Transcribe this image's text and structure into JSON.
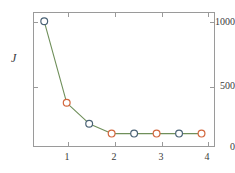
{
  "chart_data": {
    "type": "line",
    "title": "",
    "subtitle": "",
    "xlabel": "",
    "ylabel": "J",
    "x": [
      0.5,
      1.0,
      1.5,
      2.0,
      2.5,
      3.0,
      3.5,
      4.0
    ],
    "values": [
      1040,
      340,
      160,
      75,
      75,
      75,
      75,
      75
    ],
    "series": [
      {
        "name": "J",
        "x": [
          0.5,
          1.0,
          1.5,
          2.0,
          2.5,
          3.0,
          3.5,
          4.0
        ],
        "values": [
          1040,
          340,
          160,
          75,
          75,
          75,
          75,
          75
        ]
      }
    ],
    "marker_colors": [
      "#4a6275",
      "#d2663c",
      "#4a6275",
      "#d2663c",
      "#4a6275",
      "#d2663c",
      "#4a6275",
      "#d2663c"
    ],
    "line_color": "#6f8f5a",
    "marker_face_color": "#ffffff",
    "xlim": [
      0.25,
      4.3
    ],
    "ylim": [
      -40,
      1120
    ],
    "xticks": [
      1,
      2,
      3,
      4
    ],
    "xticklabels": [
      "1",
      "2",
      "3",
      "4"
    ],
    "yticks": [
      0,
      500,
      1000
    ],
    "yticklabels": [
      "0",
      "500",
      "1000"
    ],
    "grid": false,
    "legend": null,
    "legend_position": "none",
    "frame": "box",
    "annotations": []
  },
  "figure": {
    "background_color": "#ffffff",
    "axis_color": "#9a9a9a",
    "text_color": "#3a3a3a"
  }
}
